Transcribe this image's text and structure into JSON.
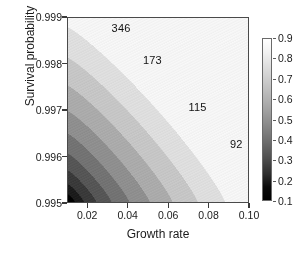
{
  "chart_data": {
    "type": "heatmap",
    "subtype": "filled-contour",
    "title": "",
    "xlabel": "Growth rate",
    "ylabel": "Survival probability",
    "xlim": [
      0.01,
      0.1
    ],
    "ylim": [
      0.995,
      0.999
    ],
    "xticks": [
      "0.02",
      "0.04",
      "0.06",
      "0.08",
      "0.10"
    ],
    "xtick_values": [
      0.02,
      0.04,
      0.06,
      0.08,
      0.1
    ],
    "yticks": [
      "0.995",
      "0.996",
      "0.997",
      "0.998",
      "0.999"
    ],
    "ytick_values": [
      0.995,
      0.996,
      0.997,
      0.998,
      0.999
    ],
    "grid": false,
    "colormap": "grayscale",
    "colorbar": {
      "min": 0.1,
      "max": 0.9,
      "position": "right",
      "ticks": [
        "0.9",
        "0.8",
        "0.7",
        "0.6",
        "0.5",
        "0.4",
        "0.3",
        "0.2",
        "0.1"
      ],
      "tick_values": [
        0.9,
        0.8,
        0.7,
        0.6,
        0.5,
        0.4,
        0.3,
        0.2,
        0.1
      ]
    },
    "contour_labels": [
      {
        "text": "346",
        "x": 0.0375,
        "y": 0.99875
      },
      {
        "text": "173",
        "x": 0.053,
        "y": 0.99805
      },
      {
        "text": "115",
        "x": 0.0755,
        "y": 0.99705
      },
      {
        "text": "92",
        "x": 0.096,
        "y": 0.99625
      }
    ],
    "band_levels": [
      0.1,
      0.2,
      0.3,
      0.4,
      0.5,
      0.6,
      0.7,
      0.8,
      0.9
    ],
    "band_colors": [
      "#000000",
      "#1c1c1c",
      "#3a3a3a",
      "#565656",
      "#737373",
      "#8f8f8f",
      "#ababab",
      "#c6c6c6",
      "#dedede",
      "#f5f5f5"
    ]
  },
  "axes": {
    "frame_color": "#4a4a4a",
    "tick_color": "#3a3a3a"
  }
}
